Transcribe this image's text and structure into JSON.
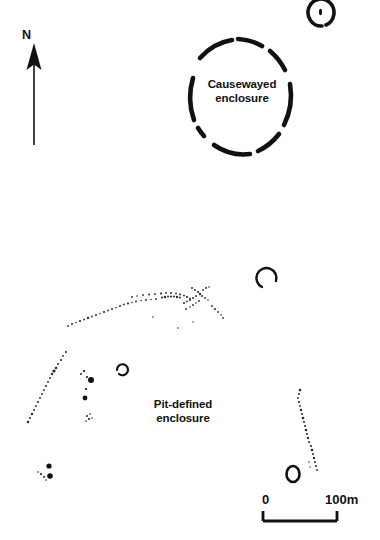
{
  "map": {
    "title": "Archaeological site plan",
    "background_color": "#ffffff",
    "ink_color": "#111111"
  },
  "north_arrow": {
    "label": "N",
    "icon": "north-arrow-icon"
  },
  "features": [
    {
      "id": "causewayed-enclosure",
      "label": "Causewayed\nenclosure",
      "type": "segmented-ring-ditch",
      "description": "Thick broken ring with causeway gaps"
    },
    {
      "id": "pit-defined-enclosure",
      "label": "Pit-defined\nenclosure",
      "type": "pit-arc",
      "description": "Large arc formed of scattered small pits"
    },
    {
      "id": "ring-ditch-north",
      "label": "",
      "type": "ring-ditch-with-central-pit",
      "description": "Small ring ditch with central pit, top right"
    },
    {
      "id": "ring-ditch-south",
      "label": "",
      "type": "oval-ring-ditch",
      "description": "Small oval ring ditch, lower right"
    },
    {
      "id": "penannular-east",
      "label": "",
      "type": "penannular-arc",
      "description": "C-shaped arc east of pit enclosure"
    },
    {
      "id": "penannular-centre",
      "label": "",
      "type": "penannular-arc",
      "description": "Small C-shaped arc within pit enclosure"
    },
    {
      "id": "pit-cluster-centre",
      "label": "",
      "type": "pit-cluster",
      "description": "Vertical line of pits within enclosure"
    },
    {
      "id": "pit-cluster-southwest",
      "label": "",
      "type": "pit-cluster",
      "description": "Paired dark pits, lower left"
    }
  ],
  "scale_bar": {
    "min_label": "0",
    "max_label": "100m",
    "length_metres": 100,
    "units": "m"
  }
}
